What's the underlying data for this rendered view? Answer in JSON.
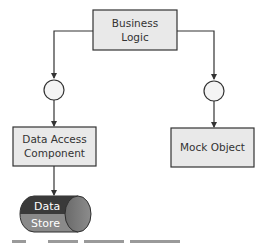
{
  "diagram": {
    "nodes": {
      "business_logic": {
        "lines": [
          "Business",
          "Logic"
        ]
      },
      "data_access": {
        "lines": [
          "Data Access",
          "Component"
        ]
      },
      "mock_object": {
        "lines": [
          "Mock Object"
        ]
      },
      "data_store": {
        "lines": [
          "Data",
          "Store"
        ]
      }
    },
    "interfaces": [
      "left-interface",
      "right-interface"
    ],
    "edges": [
      {
        "from": "business_logic",
        "to": "left-interface"
      },
      {
        "from": "left-interface",
        "to": "data_access"
      },
      {
        "from": "data_access",
        "to": "data_store"
      },
      {
        "from": "business_logic",
        "to": "right-interface"
      },
      {
        "from": "right-interface",
        "to": "mock_object"
      }
    ],
    "colors": {
      "box_fill": "#e9e9e9",
      "box_stroke": "#333333",
      "line": "#333333",
      "circle_fill": "#f4f4f4",
      "store_top": "#3a3a3a",
      "store_bottom": "#8a8a8a",
      "store_cap": "#707070"
    }
  }
}
